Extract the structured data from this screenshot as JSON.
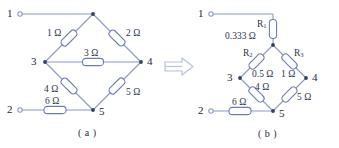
{
  "figure": {
    "transform_arrow": "double-right-arrow",
    "colors": {
      "wire": "#8c9ac6",
      "resistor_outline": "#6d7db4",
      "resistor_fill": "#ffffff",
      "node_dot": "#33415c",
      "text": "#2b3550"
    }
  },
  "circuit_a": {
    "caption": "( a )",
    "terminals": [
      {
        "label": "1",
        "marker": "open-circle"
      },
      {
        "label": "2",
        "marker": "open-circle"
      }
    ],
    "nodes": [
      {
        "label": "3"
      },
      {
        "label": "4"
      },
      {
        "label": "5"
      }
    ],
    "resistors": [
      {
        "name": "",
        "value": "1 Ω",
        "orientation": "diagonal-down-left"
      },
      {
        "name": "",
        "value": "2 Ω",
        "orientation": "diagonal-down-right"
      },
      {
        "name": "",
        "value": "3 Ω",
        "orientation": "horizontal"
      },
      {
        "name": "",
        "value": "4 Ω",
        "orientation": "diagonal-down-right"
      },
      {
        "name": "",
        "value": "5 Ω",
        "orientation": "diagonal-down-left"
      },
      {
        "name": "",
        "value": "6 Ω",
        "orientation": "horizontal"
      }
    ]
  },
  "circuit_b": {
    "caption": "( b )",
    "terminals": [
      {
        "label": "1",
        "marker": "open-circle"
      },
      {
        "label": "2",
        "marker": "open-circle"
      }
    ],
    "nodes": [
      {
        "label": "3"
      },
      {
        "label": "4"
      },
      {
        "label": "5"
      }
    ],
    "resistors": [
      {
        "name": "R",
        "sub": "1",
        "value": "0.333 Ω",
        "orientation": "vertical"
      },
      {
        "name": "R",
        "sub": "2",
        "value": "0.5 Ω",
        "orientation": "diagonal-down-left"
      },
      {
        "name": "R",
        "sub": "3",
        "value": "1 Ω",
        "orientation": "diagonal-down-right"
      },
      {
        "name": "",
        "sub": "",
        "value": "4 Ω",
        "orientation": "diagonal-down-right"
      },
      {
        "name": "",
        "sub": "",
        "value": "5 Ω",
        "orientation": "diagonal-down-left"
      },
      {
        "name": "",
        "sub": "",
        "value": "6 Ω",
        "orientation": "horizontal"
      }
    ]
  }
}
